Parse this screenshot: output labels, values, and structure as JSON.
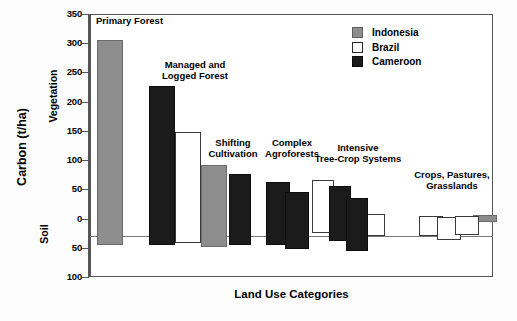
{
  "chart_data": {
    "type": "bar",
    "title": "",
    "xlabel": "Land Use Categories",
    "ylabel": "Carbon (t/ha)",
    "ylabel_upper": "Vegetation",
    "ylabel_lower": "Soil",
    "ylim": [
      -100,
      350
    ],
    "ytick_labels": [
      "350",
      "300",
      "250",
      "200",
      "150",
      "100",
      "50",
      "0",
      "50",
      "100"
    ],
    "ytick_values": [
      350,
      300,
      250,
      200,
      150,
      100,
      50,
      0,
      -50,
      -100
    ],
    "grid": false,
    "legend_position": "top-right",
    "legend": [
      {
        "name": "Indonesia",
        "color": "#8d8d8d"
      },
      {
        "name": "Brazil",
        "color": "#ffffff"
      },
      {
        "name": "Cameroon",
        "color": "#1b1b1b"
      }
    ],
    "categories": [
      "Primary Forest",
      "Managed and Logged Forest",
      "Shifting Cultivation",
      "Complex Agroforests",
      "Intensive Tree-Crop Systems",
      "Crops, Pastures, Grasslands"
    ],
    "groups": [
      {
        "category": "Primary Forest",
        "label_lines": "Primary Forest",
        "bars": [
          {
            "series": "Indonesia",
            "vegetation": 306,
            "soil": -46
          }
        ]
      },
      {
        "category": "Managed and Logged Forest",
        "label_lines": "Managed and\nLogged Forest",
        "bars": [
          {
            "series": "Cameroon",
            "vegetation": 227,
            "soil": -45
          },
          {
            "series": "Brazil",
            "vegetation": 148,
            "soil": -42
          },
          {
            "series": "Indonesia",
            "vegetation": 92,
            "soil": -48
          }
        ]
      },
      {
        "category": "Shifting Cultivation",
        "label_lines": "Shifting\nCultivation",
        "bars": [
          {
            "series": "Cameroon",
            "vegetation": 76,
            "soil": -45
          }
        ]
      },
      {
        "category": "Complex Agroforests",
        "label_lines": "Complex\nAgroforests",
        "bars": [
          {
            "series": "Cameroon",
            "vegetation": 62,
            "soil": -46
          },
          {
            "series": "Cameroon",
            "vegetation": 46,
            "soil": -52
          }
        ]
      },
      {
        "category": "Intensive Tree-Crop Systems",
        "label_lines": "Intensive\nTree-Crop Systems",
        "bars": [
          {
            "series": "Brazil",
            "vegetation": 66,
            "soil": -24
          },
          {
            "series": "Cameroon",
            "vegetation": 55,
            "soil": -38
          },
          {
            "series": "Cameroon",
            "vegetation": 35,
            "soil": -55
          },
          {
            "series": "Brazil",
            "vegetation": 8,
            "soil": -30
          }
        ]
      },
      {
        "category": "Crops, Pastures, Grasslands",
        "label_lines": "Crops, Pastures,\nGrasslands",
        "bars": [
          {
            "series": "Brazil",
            "vegetation": 4,
            "soil": -30
          },
          {
            "series": "Brazil",
            "vegetation": 3,
            "soil": -37
          },
          {
            "series": "Brazil",
            "vegetation": 5,
            "soil": -28
          },
          {
            "series": "Indonesia",
            "vegetation": 6,
            "soil": -6
          }
        ]
      }
    ]
  },
  "axis": {
    "y_title": "Carbon (t/ha)",
    "y_upper": "Vegetation",
    "y_lower": "Soil",
    "x_title": "Land Use Categories"
  },
  "legend": {
    "items": [
      {
        "label": "Indonesia"
      },
      {
        "label": "Brazil"
      },
      {
        "label": "Cameroon"
      }
    ]
  },
  "ticks": [
    {
      "label": "350"
    },
    {
      "label": "300"
    },
    {
      "label": "250"
    },
    {
      "label": "200"
    },
    {
      "label": "150"
    },
    {
      "label": "100"
    },
    {
      "label": "50"
    },
    {
      "label": "0"
    },
    {
      "label": "50"
    },
    {
      "label": "100"
    }
  ],
  "group_labels": [
    {
      "text": "Primary Forest"
    },
    {
      "text": "Managed and\nLogged Forest"
    },
    {
      "text": "Shifting\nCultivation"
    },
    {
      "text": "Complex\nAgroforests"
    },
    {
      "text": "Intensive\nTree-Crop Systems"
    },
    {
      "text": "Crops, Pastures,\nGrasslands"
    }
  ]
}
